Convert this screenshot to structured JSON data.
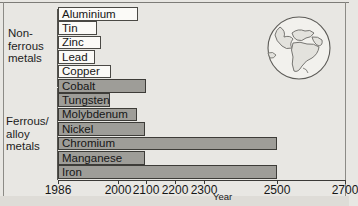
{
  "groups": {
    "nonferrous_label": "Non-\nferrous\nmetals",
    "ferrous_label": "Ferrous/\nalloy\nmetals"
  },
  "axis": {
    "title": "Year",
    "ticks": [
      {
        "label": "1986",
        "value": 1986
      },
      {
        "label": "2000",
        "value": 2000
      },
      {
        "label": "2100",
        "value": 2100
      },
      {
        "label": "2200",
        "value": 2200
      },
      {
        "label": "2300",
        "value": 2300
      },
      {
        "label": "2500",
        "value": 2500
      },
      {
        "label": "2700",
        "value": 2700
      }
    ]
  },
  "ghost_text": "",
  "icons": {
    "globe": "globe-icon"
  },
  "colors": {
    "paper": "#e8e7e3",
    "bar_white": "#fbfaf7",
    "bar_grey": "#9e9d98",
    "ink": "#1c1c1c"
  },
  "chart_data": {
    "type": "bar",
    "orientation": "horizontal",
    "title": "",
    "xlabel": "Year",
    "ylabel": "",
    "xlim": [
      1986,
      2700
    ],
    "grid": false,
    "legend": null,
    "axis_ticks": [
      1986,
      2000,
      2100,
      2200,
      2300,
      2500,
      2700
    ],
    "note": "Bar length = year that reserves of each metal are exhausted. Axis spacing is non-linear as hand-drawn.",
    "groups": [
      {
        "name": "Non-ferrous metals",
        "style": "white",
        "categories": [
          "Aluminium",
          "Tin",
          "Zinc",
          "Lead",
          "Copper"
        ],
        "values": [
          2200,
          2030,
          2040,
          2020,
          2070
        ]
      },
      {
        "name": "Ferrous/alloy metals",
        "style": "grey",
        "categories": [
          "Cobalt",
          "Tungsten",
          "Molybdenum",
          "Nickel",
          "Chromium",
          "Manganese",
          "Iron"
        ],
        "values": [
          2100,
          2030,
          2070,
          2100,
          2500,
          2100,
          2500
        ]
      }
    ],
    "categories": [
      "Aluminium",
      "Tin",
      "Zinc",
      "Lead",
      "Copper",
      "Cobalt",
      "Tungsten",
      "Molybdenum",
      "Nickel",
      "Chromium",
      "Manganese",
      "Iron"
    ],
    "values": [
      2200,
      2030,
      2040,
      2020,
      2070,
      2100,
      2030,
      2070,
      2100,
      2500,
      2100,
      2500
    ]
  },
  "bars": [
    {
      "label": "Aluminium",
      "style": "white",
      "end_px": 80
    },
    {
      "label": "Tin",
      "style": "white",
      "end_px": 39
    },
    {
      "label": "Zinc",
      "style": "white",
      "end_px": 43
    },
    {
      "label": "Lead",
      "style": "white",
      "end_px": 37
    },
    {
      "label": "Copper",
      "style": "white",
      "end_px": 53
    },
    {
      "label": "Cobalt",
      "style": "grey",
      "end_px": 88
    },
    {
      "label": "Tungsten",
      "style": "grey",
      "end_px": 52
    },
    {
      "label": "Molybdenum",
      "style": "grey",
      "end_px": 79
    },
    {
      "label": "Nickel",
      "style": "grey",
      "end_px": 87
    },
    {
      "label": "Chromium",
      "style": "grey",
      "end_px": 219
    },
    {
      "label": "Manganese",
      "style": "grey",
      "end_px": 87
    },
    {
      "label": "Iron",
      "style": "grey",
      "end_px": 219
    }
  ],
  "tick_px": [
    0,
    60,
    88,
    117,
    146,
    219,
    287
  ]
}
